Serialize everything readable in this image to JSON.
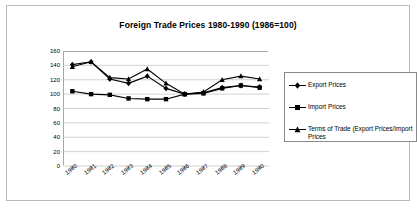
{
  "chart_data": {
    "type": "line",
    "title": "Foreign Trade Prices 1980-1990 (1986=100)",
    "xlabel": "",
    "ylabel": "",
    "categories": [
      "1980",
      "1981",
      "1982",
      "1983",
      "1984",
      "1985",
      "1986",
      "1987",
      "1988",
      "1989",
      "1990"
    ],
    "series": [
      {
        "name": "Export Prices",
        "marker": "diamond",
        "color": "#000000",
        "values": [
          141,
          145,
          121,
          115,
          125,
          108,
          100,
          102,
          109,
          112,
          110
        ]
      },
      {
        "name": "Import Prices",
        "marker": "square",
        "color": "#000000",
        "values": [
          104,
          100,
          99,
          94,
          93,
          93,
          100,
          101,
          108,
          112,
          109
        ]
      },
      {
        "name": "Terms of Trade (Export Prices/Import Prices",
        "marker": "triangle",
        "color": "#000000",
        "values": [
          138,
          145,
          123,
          121,
          135,
          115,
          100,
          103,
          120,
          125,
          121
        ]
      }
    ],
    "ylim": [
      0,
      160
    ],
    "yticks": [
      0,
      20,
      40,
      60,
      80,
      100,
      120,
      140,
      160
    ],
    "ytick_labels": [
      "0",
      "20",
      "40",
      "60",
      "80",
      "100",
      "120",
      "140",
      "160"
    ],
    "grid": true,
    "grid_axis": "y",
    "legend_position": "right"
  }
}
